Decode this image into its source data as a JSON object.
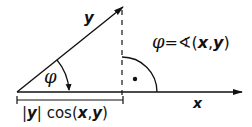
{
  "diagram": {
    "vectors": {
      "y_label": "y",
      "x_label": "x"
    },
    "angle": {
      "symbol": "φ",
      "definition": {
        "lhs": "φ",
        "eq": "=",
        "angle_sign": "∢",
        "open": "(",
        "x": "x",
        "comma": ",",
        "y": "y",
        "close": ")"
      }
    },
    "projection": {
      "bar_left": "|",
      "y": "y",
      "bar_right": "|",
      "func": " cos",
      "open": "(",
      "x": "x",
      "comma": ",",
      "y2": "y",
      "close": ")"
    },
    "right_angle_marker": "dot",
    "colors": {
      "ink": "#111111",
      "background": "#ffffff"
    }
  }
}
